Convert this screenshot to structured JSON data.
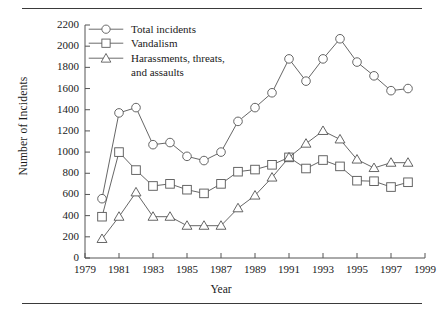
{
  "figure": {
    "rule_color": "#3a3a3a",
    "line_color": "#555555",
    "marker_fill": "#ffffff"
  },
  "chart_data": {
    "type": "line",
    "title": "",
    "xlabel": "Year",
    "ylabel": "Number of Incidents",
    "xlim": [
      1979,
      1999
    ],
    "ylim": [
      0,
      2200
    ],
    "xticks": [
      1979,
      1981,
      1983,
      1985,
      1987,
      1989,
      1991,
      1993,
      1995,
      1997,
      1999
    ],
    "yticks": [
      0,
      200,
      400,
      600,
      800,
      1000,
      1200,
      1400,
      1600,
      1800,
      2000,
      2200
    ],
    "grid": false,
    "legend_position": "upper left",
    "x": [
      1980,
      1981,
      1982,
      1983,
      1984,
      1985,
      1986,
      1987,
      1988,
      1989,
      1990,
      1991,
      1992,
      1993,
      1994,
      1995,
      1996,
      1997,
      1998
    ],
    "series": [
      {
        "name": "Total incidents",
        "marker": "circle",
        "values": [
          560,
          1370,
          1420,
          1070,
          1090,
          960,
          920,
          1000,
          1290,
          1420,
          1560,
          1880,
          1670,
          1880,
          2070,
          1850,
          1720,
          1580,
          1600
        ]
      },
      {
        "name": "Vandalism",
        "marker": "square",
        "values": [
          390,
          1000,
          830,
          680,
          700,
          645,
          610,
          700,
          815,
          835,
          880,
          950,
          845,
          925,
          865,
          730,
          725,
          670,
          715
        ]
      },
      {
        "name": "Harassments, threats, and assaults",
        "marker": "triangle",
        "values": [
          180,
          390,
          620,
          390,
          390,
          305,
          305,
          305,
          470,
          590,
          760,
          950,
          1080,
          1200,
          1120,
          930,
          850,
          900,
          900
        ]
      }
    ]
  },
  "legend": {
    "items": [
      {
        "label": "Total incidents",
        "label2": ""
      },
      {
        "label": "Vandalism",
        "label2": ""
      },
      {
        "label": "Harassments, threats,",
        "label2": "and assaults"
      }
    ]
  }
}
